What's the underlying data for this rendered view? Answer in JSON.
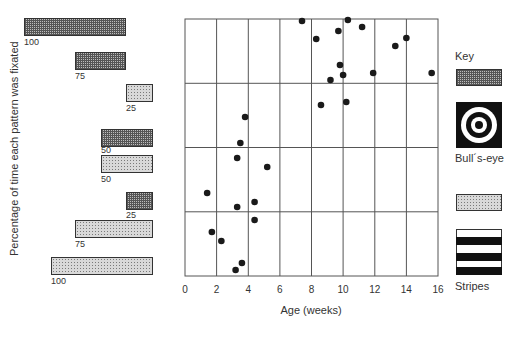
{
  "chart_data": {
    "type": "scatter",
    "title": "",
    "xlabel": "Age (weeks)",
    "ylabel": "Percentage of time each pattern was fixated",
    "xlim": [
      0,
      16
    ],
    "x_ticks": [
      "0",
      "2",
      "4",
      "6",
      "8",
      "10",
      "12",
      "14",
      "16"
    ],
    "grid": true,
    "grid_rows": 4,
    "grid_cols": 8,
    "points": [
      {
        "x": 7.4,
        "y_px": 21
      },
      {
        "x": 8.3,
        "y_px": 39
      },
      {
        "x": 9.7,
        "y_px": 31
      },
      {
        "x": 10.3,
        "y_px": 20
      },
      {
        "x": 11.2,
        "y_px": 27
      },
      {
        "x": 14.0,
        "y_px": 38
      },
      {
        "x": 13.3,
        "y_px": 46
      },
      {
        "x": 9.8,
        "y_px": 65
      },
      {
        "x": 10.0,
        "y_px": 75
      },
      {
        "x": 9.2,
        "y_px": 80
      },
      {
        "x": 11.9,
        "y_px": 73
      },
      {
        "x": 15.6,
        "y_px": 73
      },
      {
        "x": 10.2,
        "y_px": 102
      },
      {
        "x": 8.6,
        "y_px": 105
      },
      {
        "x": 3.8,
        "y_px": 117
      },
      {
        "x": 3.5,
        "y_px": 143
      },
      {
        "x": 3.3,
        "y_px": 158
      },
      {
        "x": 5.2,
        "y_px": 167
      },
      {
        "x": 1.4,
        "y_px": 193
      },
      {
        "x": 4.4,
        "y_px": 202
      },
      {
        "x": 3.3,
        "y_px": 207
      },
      {
        "x": 4.4,
        "y_px": 220
      },
      {
        "x": 1.7,
        "y_px": 232
      },
      {
        "x": 2.3,
        "y_px": 241
      },
      {
        "x": 3.6,
        "y_px": 263
      },
      {
        "x": 3.2,
        "y_px": 270
      }
    ],
    "row_reference_bars": [
      {
        "row": 1,
        "bars": [
          {
            "pattern": "Bull's-eye",
            "value": 100
          },
          {
            "pattern": "Bull's-eye",
            "value": 75
          },
          {
            "pattern": "Stripes",
            "value": 25
          }
        ]
      },
      {
        "row": 2,
        "bars": [
          {
            "pattern": "Bull's-eye",
            "value": 50
          },
          {
            "pattern": "Stripes",
            "value": 50
          }
        ]
      },
      {
        "row": 3,
        "bars": [
          {
            "pattern": "Bull's-eye",
            "value": 25
          },
          {
            "pattern": "Stripes",
            "value": 75
          },
          {
            "pattern": "Stripes",
            "value": 100
          }
        ]
      }
    ],
    "legend": {
      "title": "Key",
      "entries": [
        "Bull's-eye",
        "Stripes"
      ],
      "position": "right"
    }
  },
  "labels": {
    "ylabel": "Percentage of time each pattern was fixated",
    "xlabel": "Age (weeks)",
    "key_title": "Key",
    "key_bullseye": "Bull´s-eye",
    "key_stripes": "Stripes"
  },
  "bars": [
    {
      "value": "100",
      "type": "check"
    },
    {
      "value": "75",
      "type": "check"
    },
    {
      "value": "25",
      "type": "stipple"
    },
    {
      "value": "50",
      "type": "check"
    },
    {
      "value": "50",
      "type": "stipple"
    },
    {
      "value": "25",
      "type": "check"
    },
    {
      "value": "75",
      "type": "stipple"
    },
    {
      "value": "100",
      "type": "stipple"
    }
  ],
  "x_ticks": [
    "0",
    "2",
    "4",
    "6",
    "8",
    "10",
    "12",
    "14",
    "16"
  ]
}
